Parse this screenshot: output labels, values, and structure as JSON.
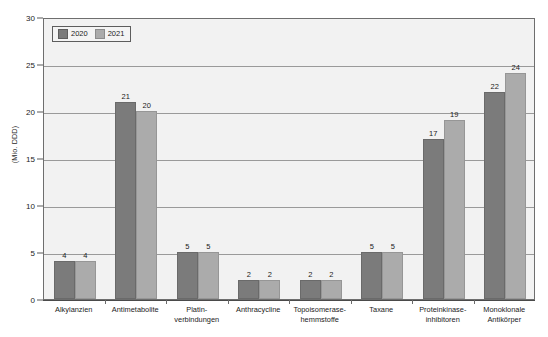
{
  "chart_data": {
    "type": "bar",
    "title": "",
    "subtitle": "",
    "xlabel": "",
    "ylabel": "(Mio. DDD)",
    "ylim": [
      0,
      30
    ],
    "yticks": [
      0,
      5,
      10,
      15,
      20,
      25,
      30
    ],
    "ytick_labels": [
      "0",
      "5",
      "10",
      "15",
      "20",
      "25",
      "30"
    ],
    "grid": true,
    "grid_axis": "y",
    "legend_position": "top-left",
    "categories": [
      "Alkylanzien",
      "Antimetabolite",
      "Platin-\nverbindungen",
      "Anthracycline",
      "Topoisomerase-\nhemmstoffe",
      "Taxane",
      "Proteinkinase-\ninhibitoren",
      "Monoklonale\nAntikörper"
    ],
    "series": [
      {
        "name": "2020",
        "color": "#7b7b7b",
        "values": [
          4,
          21,
          5,
          2,
          2,
          5,
          17,
          22
        ],
        "labels": [
          "4",
          "21",
          "5",
          "2",
          "2",
          "5",
          "17",
          "22"
        ]
      },
      {
        "name": "2021",
        "color": "#ababab",
        "values": [
          4,
          20,
          5,
          2,
          2,
          5,
          19,
          24
        ],
        "labels": [
          "4",
          "20",
          "5",
          "2",
          "2",
          "5",
          "19",
          "24"
        ]
      }
    ]
  },
  "legend": {
    "entries": [
      {
        "label": "2020",
        "swatch": "legend-swatch-2020"
      },
      {
        "label": "2021",
        "swatch": "legend-swatch-2021"
      }
    ]
  },
  "colors": {
    "series_2020": "#7b7b7b",
    "series_2021": "#ababab",
    "plot_background": "#f2f2f2",
    "plot_border": "#6e6e6e",
    "gridline": "#9a9a9a",
    "axis": "#4a4a4a",
    "text": "#1b1b1b",
    "page_background": "#ffffff"
  }
}
